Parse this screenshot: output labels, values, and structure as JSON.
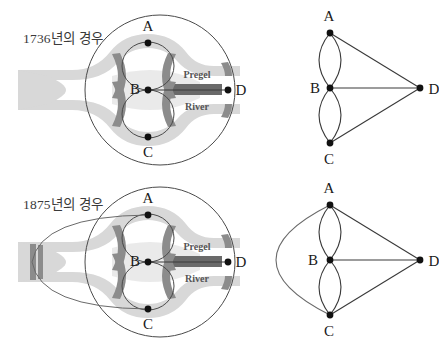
{
  "figure": {
    "background_color": "#ffffff"
  },
  "colors": {
    "ink": "#2b2b2b",
    "caption_text": "#3a3a3a",
    "river_light": "#d8d8d8",
    "river_mid": "#c9c9c9",
    "bridge_gray": "#8c8c8c",
    "island_bar": "#6a6a6a",
    "node_fill": "#111111",
    "edge_stroke": "#3a3a3a",
    "map_outline": "#4a4a4a"
  },
  "panels": [
    {
      "id": "1736",
      "caption": "1736년의 경우",
      "map": {
        "name": "konigsberg-map-1736",
        "river_label_top": "Pregel",
        "river_label_bottom": "River",
        "nodes": [
          {
            "id": "A",
            "label": "A",
            "x": 148,
            "y": 43,
            "label_dx": 0,
            "label_dy": -12
          },
          {
            "id": "B",
            "label": "B",
            "x": 148,
            "y": 90,
            "label_dx": -13,
            "label_dy": 4
          },
          {
            "id": "C",
            "label": "C",
            "x": 148,
            "y": 137,
            "label_dx": 0,
            "label_dy": 20
          },
          {
            "id": "D",
            "label": "D",
            "x": 228,
            "y": 90,
            "label_dx": 13,
            "label_dy": 5
          }
        ],
        "bridge_count": 7,
        "bridges": [
          "A-B north-left",
          "A-B north-right",
          "B-C south-left",
          "B-C south-right",
          "A-D east-upper",
          "B-D island",
          "C-D east-lower"
        ]
      },
      "graph": {
        "name": "konigsberg-graph-1736",
        "edge_count": 7,
        "nodes": [
          {
            "id": "A",
            "label": "A",
            "x": 62,
            "y": 33,
            "label_dx": -1,
            "label_dy": -13
          },
          {
            "id": "B",
            "label": "B",
            "x": 62,
            "y": 88,
            "label_dx": -14,
            "label_dy": 4
          },
          {
            "id": "C",
            "label": "C",
            "x": 62,
            "y": 143,
            "label_dx": -1,
            "label_dy": 21
          },
          {
            "id": "D",
            "label": "D",
            "x": 152,
            "y": 88,
            "label_dx": 14,
            "label_dy": 5
          }
        ],
        "edges": [
          "A-B (left arc)",
          "A-B (right arc)",
          "B-C (left arc)",
          "B-C (right arc)",
          "A-D",
          "B-D",
          "C-D"
        ]
      }
    },
    {
      "id": "1875",
      "caption": "1875년의 경우",
      "map": {
        "name": "konigsberg-map-1875",
        "river_label_top": "Pregel",
        "river_label_bottom": "River",
        "nodes": [
          {
            "id": "A",
            "label": "A",
            "x": 148,
            "y": 43,
            "label_dx": 0,
            "label_dy": -12
          },
          {
            "id": "B",
            "label": "B",
            "x": 148,
            "y": 90,
            "label_dx": -13,
            "label_dy": 4
          },
          {
            "id": "C",
            "label": "C",
            "x": 148,
            "y": 137,
            "label_dx": 0,
            "label_dy": 20
          },
          {
            "id": "D",
            "label": "D",
            "x": 228,
            "y": 90,
            "label_dx": 13,
            "label_dy": 5
          }
        ],
        "bridge_count": 8,
        "bridges": [
          "A-B north-left",
          "A-B north-right",
          "B-C south-left",
          "B-C south-right",
          "A-D east-upper",
          "B-D island",
          "C-D east-lower",
          "A-C west trunk"
        ]
      },
      "graph": {
        "name": "konigsberg-graph-1875",
        "edge_count": 8,
        "nodes": [
          {
            "id": "A",
            "label": "A",
            "x": 62,
            "y": 33,
            "label_dx": -1,
            "label_dy": -13
          },
          {
            "id": "B",
            "label": "B",
            "x": 62,
            "y": 88,
            "label_dx": -14,
            "label_dy": 4
          },
          {
            "id": "C",
            "label": "C",
            "x": 62,
            "y": 143,
            "label_dx": -1,
            "label_dy": 21
          },
          {
            "id": "D",
            "label": "D",
            "x": 152,
            "y": 88,
            "label_dx": 14,
            "label_dy": 5
          }
        ],
        "edges": [
          "A-B (left arc)",
          "A-B (right arc)",
          "B-C (left arc)",
          "B-C (right arc)",
          "A-D",
          "B-D",
          "C-D",
          "A-C (outer left arc)"
        ]
      }
    }
  ]
}
